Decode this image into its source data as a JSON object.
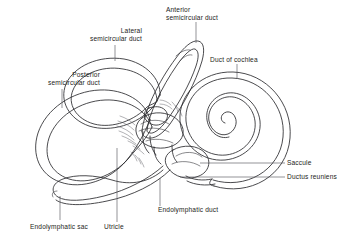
{
  "figure": {
    "style": "black-and-white-line-drawing",
    "background_color": "#ffffff",
    "ink_color": "#2a2a2e",
    "leader_color": "#4a4a50"
  },
  "labels": {
    "anterior_semicircular_duct": {
      "line1": "Anterior",
      "line2": "semicircular duct"
    },
    "lateral_semicircular_duct": {
      "line1": "Lateral",
      "line2": "semicircular duct"
    },
    "posterior_semicircular_duct": {
      "line1": "Posterior",
      "line2": "semicircular duct"
    },
    "duct_of_cochlea": {
      "line1": "Duct of cochlea"
    },
    "saccule": {
      "line1": "Saccule"
    },
    "ductus_reuniens": {
      "line1": "Ductus reuniens"
    },
    "endolymphatic_duct": {
      "line1": "Endolymphatic duct"
    },
    "utricle": {
      "line1": "Utricle"
    },
    "endolymphatic_sac": {
      "line1": "Endolymphatic sac"
    }
  },
  "structures": [
    "anterior semicircular duct",
    "lateral semicircular duct",
    "posterior semicircular duct",
    "duct of cochlea",
    "saccule",
    "ductus reuniens",
    "endolymphatic duct",
    "utricle",
    "endolymphatic sac"
  ]
}
